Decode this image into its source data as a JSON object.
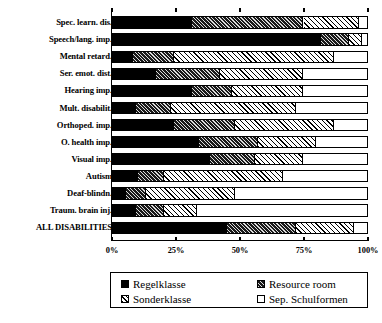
{
  "chart_data": {
    "type": "bar",
    "orientation": "horizontal",
    "stacked": true,
    "title": "",
    "xlabel": "",
    "ylabel": "",
    "xlim": [
      0,
      100
    ],
    "xticks": [
      "0%",
      "25%",
      "50%",
      "75%",
      "100%"
    ],
    "xtick_values": [
      0,
      25,
      50,
      75,
      100
    ],
    "grid": false,
    "legend_position": "bottom",
    "categories": [
      "Spec. learn. dis.",
      "Speech/lang. imp.",
      "Mental retard.",
      "Ser. emot. dist.",
      "Hearing imp.",
      "Mult. disabilit.",
      "Orthoped. imp.",
      "O. health imp.",
      "Visual imp.",
      "Autism",
      "Deaf-blindn.",
      "Traum. brain inj.",
      "ALL DISABILITIES"
    ],
    "series": [
      {
        "name": "Regelklasse",
        "fill": "fill-regelklasse",
        "values": [
          31.0,
          82.0,
          8.0,
          17.0,
          31.0,
          9.0,
          24.0,
          34.0,
          38.0,
          10.0,
          5.0,
          9.0,
          45.0
        ]
      },
      {
        "name": "Resource room",
        "fill": "fill-resource",
        "values": [
          44.0,
          11.0,
          16.0,
          25.0,
          16.0,
          14.0,
          24.0,
          23.0,
          18.0,
          10.0,
          8.0,
          11.0,
          27.0
        ]
      },
      {
        "name": "Sonderklasse",
        "fill": "fill-sonderklasse",
        "values": [
          22.0,
          5.0,
          63.0,
          33.0,
          28.0,
          49.0,
          39.0,
          23.0,
          19.0,
          47.0,
          35.0,
          13.0,
          23.0
        ]
      },
      {
        "name": "Sep. Schulformen",
        "fill": "fill-sep",
        "values": [
          3.0,
          2.0,
          13.0,
          25.0,
          25.0,
          28.0,
          13.0,
          20.0,
          25.0,
          33.0,
          52.0,
          67.0,
          5.0
        ]
      }
    ]
  },
  "legend": {
    "items": [
      {
        "label": "Regelklasse",
        "swatch": "fill-regelklasse"
      },
      {
        "label": "Resource room",
        "swatch": "fill-resource"
      },
      {
        "label": "Sonderklasse",
        "swatch": "fill-sonderklasse"
      },
      {
        "label": "Sep. Schulformen",
        "swatch": "fill-sep"
      }
    ]
  }
}
